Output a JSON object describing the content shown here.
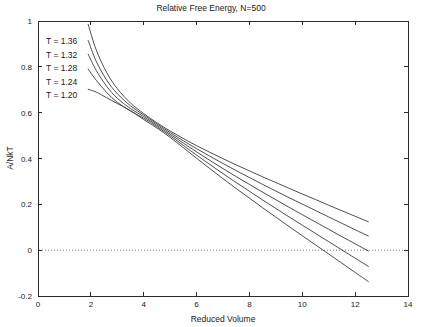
{
  "chart_data": {
    "type": "line",
    "title": "Relative Free Energy, N=500",
    "xlabel": "Reduced Volume",
    "ylabel": "A/NkT",
    "xlim": [
      0,
      14
    ],
    "ylim": [
      -0.2,
      1
    ],
    "xticks": [
      0,
      2,
      4,
      6,
      8,
      10,
      12,
      14
    ],
    "xtick_labels": [
      "0",
      "2",
      "4",
      "6",
      "8",
      "10",
      "12",
      "14"
    ],
    "yticks": [
      -0.2,
      0,
      0.2,
      0.4,
      0.6,
      0.8,
      1
    ],
    "ytick_labels": [
      "-0.2",
      "0",
      "0.2",
      "0.4",
      "0.6",
      "0.8",
      "1"
    ],
    "grid": false,
    "legend_position": "upper-left-inside",
    "zero_reference_line": 0,
    "series": [
      {
        "name": "T = 1.36",
        "x": [
          1.9,
          2.2,
          2.6,
          3.0,
          3.5,
          4.0,
          4.5,
          5.0,
          5.5,
          6.0,
          6.5,
          7.0,
          7.5,
          8.0,
          8.5,
          9.0,
          9.5,
          10.0,
          10.5,
          11.0,
          11.5,
          12.0,
          12.5
        ],
        "y": [
          0.985,
          0.875,
          0.775,
          0.705,
          0.642,
          0.596,
          0.556,
          0.52,
          0.487,
          0.456,
          0.427,
          0.399,
          0.372,
          0.346,
          0.32,
          0.295,
          0.27,
          0.245,
          0.221,
          0.196,
          0.172,
          0.148,
          0.124
        ]
      },
      {
        "name": "T = 1.32",
        "x": [
          1.9,
          2.2,
          2.6,
          3.0,
          3.5,
          4.0,
          4.5,
          5.0,
          5.5,
          6.0,
          6.5,
          7.0,
          7.5,
          8.0,
          8.5,
          9.0,
          9.5,
          10.0,
          10.5,
          11.0,
          11.5,
          12.0,
          12.5
        ],
        "y": [
          0.915,
          0.825,
          0.742,
          0.683,
          0.63,
          0.59,
          0.551,
          0.513,
          0.477,
          0.443,
          0.41,
          0.378,
          0.347,
          0.317,
          0.287,
          0.258,
          0.229,
          0.201,
          0.173,
          0.145,
          0.117,
          0.089,
          0.062
        ]
      },
      {
        "name": "T = 1.28",
        "x": [
          1.9,
          2.2,
          2.6,
          3.0,
          3.5,
          4.0,
          4.5,
          5.0,
          5.5,
          6.0,
          6.5,
          7.0,
          7.5,
          8.0,
          8.5,
          9.0,
          9.5,
          10.0,
          10.5,
          11.0,
          11.5,
          12.0,
          12.5
        ],
        "y": [
          0.855,
          0.785,
          0.715,
          0.663,
          0.618,
          0.583,
          0.545,
          0.506,
          0.467,
          0.429,
          0.392,
          0.356,
          0.321,
          0.287,
          0.253,
          0.22,
          0.187,
          0.155,
          0.123,
          0.091,
          0.059,
          0.028,
          -0.004
        ]
      },
      {
        "name": "T = 1.24",
        "x": [
          1.9,
          2.2,
          2.6,
          3.0,
          3.5,
          4.0,
          4.5,
          5.0,
          5.5,
          6.0,
          6.5,
          7.0,
          7.5,
          8.0,
          8.5,
          9.0,
          9.5,
          10.0,
          10.5,
          11.0,
          11.5,
          12.0,
          12.5
        ],
        "y": [
          0.79,
          0.742,
          0.688,
          0.645,
          0.607,
          0.576,
          0.539,
          0.499,
          0.457,
          0.415,
          0.374,
          0.334,
          0.295,
          0.257,
          0.219,
          0.182,
          0.145,
          0.109,
          0.073,
          0.037,
          0.001,
          -0.035,
          -0.071
        ]
      },
      {
        "name": "T = 1.20",
        "x": [
          1.9,
          2.2,
          2.6,
          3.0,
          3.5,
          4.0,
          4.5,
          5.0,
          5.5,
          6.0,
          6.5,
          7.0,
          7.5,
          8.0,
          8.5,
          9.0,
          9.5,
          10.0,
          10.5,
          11.0,
          11.5,
          12.0,
          12.5
        ],
        "y": [
          0.702,
          0.69,
          0.665,
          0.64,
          0.609,
          0.57,
          0.533,
          0.492,
          0.447,
          0.401,
          0.356,
          0.312,
          0.269,
          0.227,
          0.185,
          0.144,
          0.103,
          0.063,
          0.023,
          -0.017,
          -0.057,
          -0.097,
          -0.137
        ]
      }
    ],
    "legend_entries": [
      "T = 1.36",
      "T = 1.32",
      "T = 1.28",
      "T = 1.24",
      "T = 1.20"
    ],
    "colors": {
      "curve": "#3a3a3a",
      "axis": "#2a2a2a",
      "zero_line": "#5a5a5a",
      "background": "#ffffff"
    }
  }
}
